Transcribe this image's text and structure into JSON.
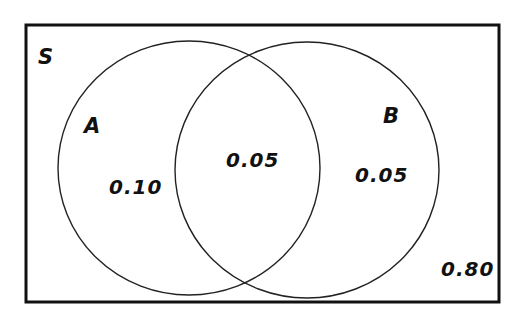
{
  "diagram": {
    "type": "venn",
    "universe_label": "S",
    "sets": [
      {
        "name": "A",
        "label": "A"
      },
      {
        "name": "B",
        "label": "B"
      }
    ],
    "regions": {
      "a_only": "0.10",
      "a_and_b": "0.05",
      "b_only": "0.05",
      "neither": "0.80"
    },
    "colors": {
      "stroke": "#111111",
      "background": "#ffffff"
    }
  }
}
